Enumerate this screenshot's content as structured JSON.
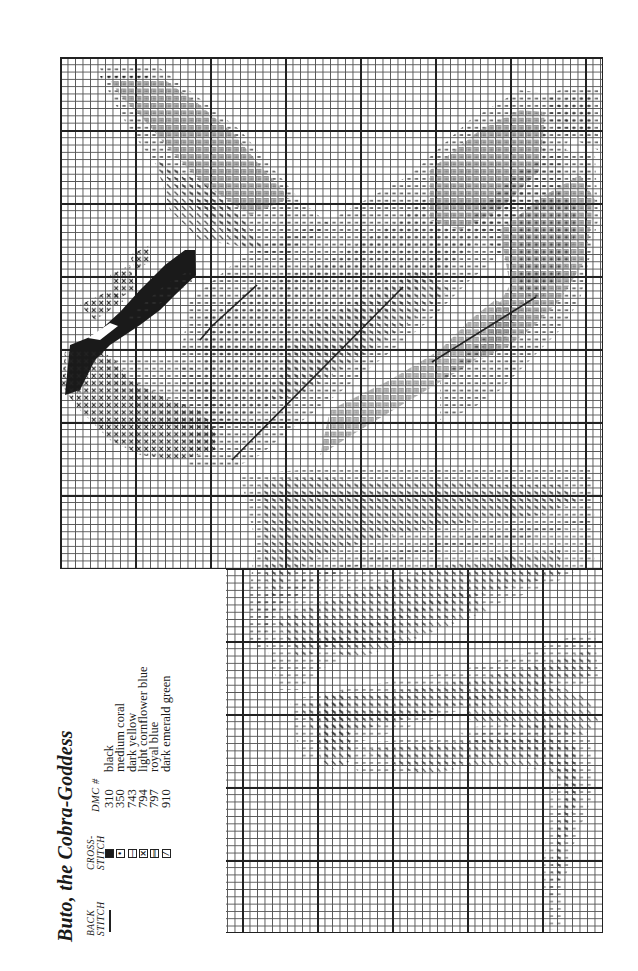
{
  "chart": {
    "title": "Buto, the Cobra-Goddess",
    "headers": {
      "back_stitch": "BACK STITCH",
      "cross_stitch": "CROSS-STITCH",
      "dmc": "DMC #"
    },
    "key": [
      {
        "symbol": "solid-square",
        "glyph": "",
        "dmc": "310",
        "name": "black",
        "fill": "#1a1a1a"
      },
      {
        "symbol": "dot",
        "glyph": "•",
        "dmc": "350",
        "name": "medium coral",
        "fill": "#ffffff"
      },
      {
        "symbol": "single-bar",
        "glyph": "|",
        "dmc": "743",
        "name": "dark yellow",
        "fill": "#ffffff"
      },
      {
        "symbol": "x-cross",
        "glyph": "×",
        "dmc": "794",
        "name": "light cornflower blue",
        "fill": "#ffffff"
      },
      {
        "symbol": "double-bar",
        "glyph": "‖",
        "dmc": "797",
        "name": "royal blue",
        "fill": "#ffffff"
      },
      {
        "symbol": "diagonal-slash",
        "glyph": "⁄",
        "dmc": "910",
        "name": "dark emerald green",
        "fill": "#ffffff"
      }
    ],
    "back_stitch": {
      "symbol": "line",
      "dmc": "310",
      "color": "#222222"
    }
  }
}
